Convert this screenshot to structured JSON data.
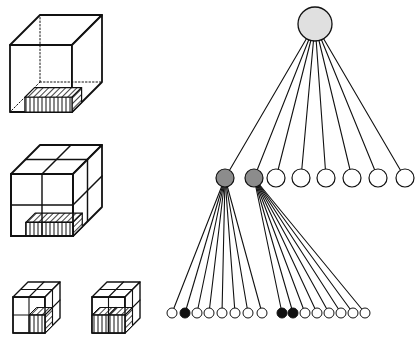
{
  "figure": {
    "colors": {
      "stroke": "#111111",
      "background": "#ffffff",
      "root_fill": "#e0e0e0",
      "internal_fill": "#8c8c8c",
      "leaf_empty_fill": "#ffffff",
      "leaf_occupied_fill": "#111111"
    },
    "cubes": [
      {
        "id": "level-0",
        "x": 10,
        "y": 45,
        "size": 62,
        "height": 67,
        "depth": 30,
        "divisions": 1,
        "hidden_edges_dotted": true,
        "object": "partial-bottom-slab"
      },
      {
        "id": "level-1",
        "x": 11,
        "y": 174,
        "size": 62,
        "height": 62,
        "depth": 29,
        "divisions": 2,
        "object": "partial-bottom-slab"
      },
      {
        "id": "level-2a",
        "x": 13,
        "y": 297,
        "size": 32,
        "height": 36,
        "depth": 15,
        "divisions": 2,
        "object": "bottom-right-cell"
      },
      {
        "id": "level-2b",
        "x": 92,
        "y": 297,
        "size": 33,
        "height": 36,
        "depth": 15,
        "divisions": 2,
        "object": "bottom-front-row"
      }
    ],
    "tree": {
      "root": {
        "cx": 315,
        "cy": 24,
        "r": 17,
        "type": "root"
      },
      "level1": [
        {
          "cx": 225,
          "cy": 178,
          "r": 9,
          "type": "internal"
        },
        {
          "cx": 254,
          "cy": 178,
          "r": 9,
          "type": "internal"
        },
        {
          "cx": 276,
          "cy": 178,
          "r": 9,
          "type": "empty"
        },
        {
          "cx": 301,
          "cy": 178,
          "r": 9,
          "type": "empty"
        },
        {
          "cx": 326,
          "cy": 178,
          "r": 9,
          "type": "empty"
        },
        {
          "cx": 352,
          "cy": 178,
          "r": 9,
          "type": "empty"
        },
        {
          "cx": 378,
          "cy": 178,
          "r": 9,
          "type": "empty"
        },
        {
          "cx": 405,
          "cy": 178,
          "r": 9,
          "type": "empty"
        }
      ],
      "level2": [
        {
          "parent": 0,
          "leaves": [
            {
              "cx": 172,
              "type": "empty"
            },
            {
              "cx": 185,
              "type": "occupied"
            },
            {
              "cx": 197,
              "type": "empty"
            },
            {
              "cx": 209,
              "type": "empty"
            },
            {
              "cx": 222,
              "type": "empty"
            },
            {
              "cx": 235,
              "type": "empty"
            },
            {
              "cx": 248,
              "type": "empty"
            },
            {
              "cx": 262,
              "type": "empty"
            }
          ]
        },
        {
          "parent": 1,
          "leaves": [
            {
              "cx": 282,
              "type": "occupied"
            },
            {
              "cx": 293,
              "type": "occupied"
            },
            {
              "cx": 305,
              "type": "empty"
            },
            {
              "cx": 317,
              "type": "empty"
            },
            {
              "cx": 329,
              "type": "empty"
            },
            {
              "cx": 341,
              "type": "empty"
            },
            {
              "cx": 353,
              "type": "empty"
            },
            {
              "cx": 365,
              "type": "empty"
            }
          ]
        }
      ],
      "leaf_cy": 313,
      "leaf_r": 5
    }
  }
}
